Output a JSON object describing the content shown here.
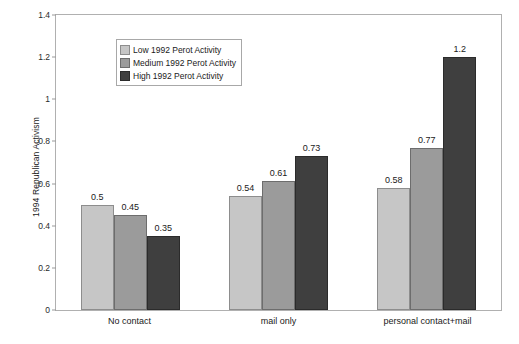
{
  "chart_data": {
    "type": "bar",
    "title": "",
    "xlabel": "",
    "ylabel": "1994 Republican Activism",
    "ylim": [
      0,
      1.4
    ],
    "ytick_labels": [
      "0",
      "0.2",
      "0.4",
      "0.6",
      "0.8",
      "1",
      "1.2",
      "1.4"
    ],
    "ytick_values": [
      0,
      0.2,
      0.4,
      0.6,
      0.8,
      1,
      1.2,
      1.4
    ],
    "grid": false,
    "legend_position": "top-left-inside",
    "categories": [
      "No contact",
      "mail only",
      "personal contact+mail"
    ],
    "series": [
      {
        "name": "Low 1992 Perot Activity",
        "color": "#c6c6c6",
        "values": [
          0.5,
          0.54,
          0.58
        ],
        "value_labels": [
          "0.5",
          "0.54",
          "0.58"
        ]
      },
      {
        "name": "Medium 1992 Perot Activity",
        "color": "#9b9b9b",
        "values": [
          0.45,
          0.61,
          0.77
        ],
        "value_labels": [
          "0.45",
          "0.61",
          "0.77"
        ]
      },
      {
        "name": "High 1992 Perot Activity",
        "color": "#3f3f3f",
        "values": [
          0.35,
          0.73,
          1.2
        ],
        "value_labels": [
          "0.35",
          "0.73",
          "1.2"
        ]
      }
    ]
  }
}
